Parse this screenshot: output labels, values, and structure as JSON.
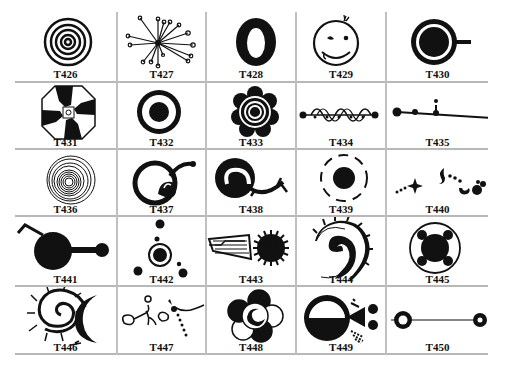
{
  "table": {
    "columns": 5,
    "rows": 5,
    "cells": [
      {
        "code": "T426",
        "icon": "concentric-circles-icon"
      },
      {
        "code": "T427",
        "icon": "radiating-lines-icon"
      },
      {
        "code": "T428",
        "icon": "thick-ring-icon"
      },
      {
        "code": "T429",
        "icon": "smiley-face-icon"
      },
      {
        "code": "T430",
        "icon": "cup-icon"
      },
      {
        "code": "T431",
        "icon": "octagon-swirl-icon"
      },
      {
        "code": "T432",
        "icon": "ring-with-moon-icon"
      },
      {
        "code": "T433",
        "icon": "flower-rosette-icon"
      },
      {
        "code": "T434",
        "icon": "wave-chain-icon"
      },
      {
        "code": "T435",
        "icon": "line-with-dots-icon"
      },
      {
        "code": "T436",
        "icon": "spiral-icon"
      },
      {
        "code": "T437",
        "icon": "curled-circle-icon"
      },
      {
        "code": "T438",
        "icon": "yin-curl-branch-icon"
      },
      {
        "code": "T439",
        "icon": "dashed-orbit-icon"
      },
      {
        "code": "T440",
        "icon": "scattered-figures-icon"
      },
      {
        "code": "T441",
        "icon": "disc-with-arm-icon"
      },
      {
        "code": "T442",
        "icon": "dot-constellation-icon"
      },
      {
        "code": "T443",
        "icon": "comb-sun-icon"
      },
      {
        "code": "T444",
        "icon": "spiked-spiral-icon"
      },
      {
        "code": "T445",
        "icon": "ringed-disc-four-lobes-icon"
      },
      {
        "code": "T446",
        "icon": "spiral-sun-moon-icon"
      },
      {
        "code": "T447",
        "icon": "figure-scene-icon"
      },
      {
        "code": "T448",
        "icon": "overlapping-circles-icon"
      },
      {
        "code": "T449",
        "icon": "half-disc-triangle-icon"
      },
      {
        "code": "T450",
        "icon": "two-rings-line-icon"
      }
    ]
  },
  "colors": {
    "ink": "#111111",
    "grid": "#b8b8b8",
    "background": "#ffffff"
  }
}
